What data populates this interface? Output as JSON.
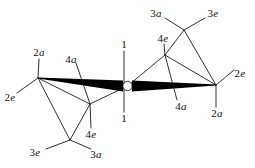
{
  "figure": {
    "name": "cyclopropane-ring-conformation-diagram",
    "type": "chemical-structure-sawhorse-projection",
    "background_color": "#ffffff",
    "line_color": "#1a1a1a",
    "wedge_color": "#000000",
    "center_ring_fill": "#ffffff"
  },
  "labels": [
    {
      "id": "l1-top",
      "num": "1",
      "pos": "",
      "x": 124,
      "y": 44
    },
    {
      "id": "l1-bottom",
      "num": "1",
      "pos": "",
      "x": 124,
      "y": 118
    },
    {
      "id": "l2a-left",
      "num": "2",
      "pos": "a",
      "x": 39,
      "y": 52
    },
    {
      "id": "l2e-left",
      "num": "2",
      "pos": "e",
      "x": 10,
      "y": 97
    },
    {
      "id": "l4a-left",
      "num": "4",
      "pos": "a",
      "x": 71,
      "y": 59
    },
    {
      "id": "l4e-left",
      "num": "4",
      "pos": "e",
      "x": 91,
      "y": 134
    },
    {
      "id": "l3e-left",
      "num": "3",
      "pos": "e",
      "x": 35,
      "y": 152
    },
    {
      "id": "l3a-left",
      "num": "3",
      "pos": "a",
      "x": 96,
      "y": 154
    },
    {
      "id": "l4e-right",
      "num": "4",
      "pos": "e",
      "x": 163,
      "y": 38
    },
    {
      "id": "l3a-right",
      "num": "3",
      "pos": "a",
      "x": 156,
      "y": 13
    },
    {
      "id": "l3e-right",
      "num": "3",
      "pos": "e",
      "x": 213,
      "y": 13
    },
    {
      "id": "l2e-right",
      "num": "2",
      "pos": "e",
      "x": 240,
      "y": 73
    },
    {
      "id": "l2a-right",
      "num": "2",
      "pos": "a",
      "x": 217,
      "y": 113
    },
    {
      "id": "l4a-right",
      "num": "4",
      "pos": "a",
      "x": 181,
      "y": 106
    }
  ],
  "geometry": {
    "vertices": {
      "c1_center": {
        "x": 127.5,
        "y": 86
      },
      "c2_left": {
        "x": 38,
        "y": 78
      },
      "c2_right": {
        "x": 216,
        "y": 85
      },
      "c4_left_front": {
        "x": 90,
        "y": 104
      },
      "c4_right_back": {
        "x": 165,
        "y": 55
      },
      "c3_left_down": {
        "x": 70,
        "y": 140
      },
      "c3_right_up": {
        "x": 184,
        "y": 30
      }
    },
    "ring_radius": 4.6,
    "wedge_max_half_width": 5.4
  },
  "bonds": [
    {
      "name": "c1-c2-left-wedge",
      "kind": "wedge"
    },
    {
      "name": "c1-c2-right-wedge",
      "kind": "wedge"
    },
    {
      "name": "c2left-c4left",
      "kind": "line"
    },
    {
      "name": "c4left-c1",
      "kind": "line"
    },
    {
      "name": "c2left-c3left",
      "kind": "line"
    },
    {
      "name": "c3left-c4left",
      "kind": "line"
    },
    {
      "name": "c2right-c4right",
      "kind": "line"
    },
    {
      "name": "c4right-c1",
      "kind": "line"
    },
    {
      "name": "c2right-c3right",
      "kind": "line"
    },
    {
      "name": "c3right-c4right",
      "kind": "line"
    }
  ],
  "substituent_bonds": [
    {
      "name": "c1-h1-axial-up",
      "from": "c1_center",
      "to": {
        "x": 124,
        "y": 51
      }
    },
    {
      "name": "c1-h1-axial-down",
      "from": "c1_center",
      "to": {
        "x": 124,
        "y": 112
      }
    },
    {
      "name": "c2left-h2a",
      "from": "c2_left",
      "to": {
        "x": 39,
        "y": 59
      }
    },
    {
      "name": "c2left-h2e",
      "from": "c2_left",
      "to": {
        "x": 17,
        "y": 93
      }
    },
    {
      "name": "c4left-h4a",
      "from": "c4_left_front",
      "to": {
        "x": 76,
        "y": 63
      }
    },
    {
      "name": "c4left-h4e",
      "from": "c4_left_front",
      "to": {
        "x": 91,
        "y": 128
      }
    },
    {
      "name": "c3left-h3e",
      "from": "c3_left_down",
      "to": {
        "x": 46,
        "y": 149
      }
    },
    {
      "name": "c3left-h3a",
      "from": "c3_left_down",
      "to": {
        "x": 91,
        "y": 149
      }
    },
    {
      "name": "c4right-h4e",
      "from": "c4_right_back",
      "to": {
        "x": 164,
        "y": 44
      }
    },
    {
      "name": "c4right-h4a",
      "from": "c4_right_back",
      "to": {
        "x": 177,
        "y": 100
      }
    },
    {
      "name": "c3right-h3a",
      "from": "c3_right_up",
      "to": {
        "x": 165,
        "y": 18
      }
    },
    {
      "name": "c3right-h3e",
      "from": "c3_right_up",
      "to": {
        "x": 205,
        "y": 18
      }
    },
    {
      "name": "c2right-h2e",
      "from": "c2_right",
      "to": {
        "x": 234,
        "y": 70
      }
    },
    {
      "name": "c2right-h2a",
      "from": "c2_right",
      "to": {
        "x": 216,
        "y": 107
      }
    }
  ]
}
